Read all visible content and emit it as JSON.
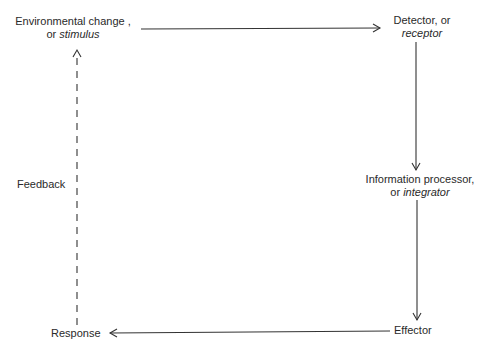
{
  "diagram": {
    "type": "feedback-loop",
    "nodes": {
      "stimulus": {
        "line1": "Environmental change ,",
        "line2_prefix": "or ",
        "line2_italic": "stimulus"
      },
      "receptor": {
        "line1": "Detector, or",
        "line2_italic": "receptor"
      },
      "integrator": {
        "line1": "Information processor,",
        "line2_prefix": "or ",
        "line2_italic": "integrator"
      },
      "effector": {
        "label_italic": "Effector"
      },
      "response": {
        "label_italic": "Response"
      }
    },
    "edges": [
      {
        "from": "stimulus",
        "to": "receptor",
        "style": "solid"
      },
      {
        "from": "receptor",
        "to": "integrator",
        "style": "solid"
      },
      {
        "from": "integrator",
        "to": "effector",
        "style": "solid"
      },
      {
        "from": "effector",
        "to": "response",
        "style": "solid"
      },
      {
        "from": "response",
        "to": "stimulus",
        "style": "dashed",
        "label": "Feedback"
      }
    ],
    "feedback_label": "Feedback",
    "line_color": "#333333"
  }
}
